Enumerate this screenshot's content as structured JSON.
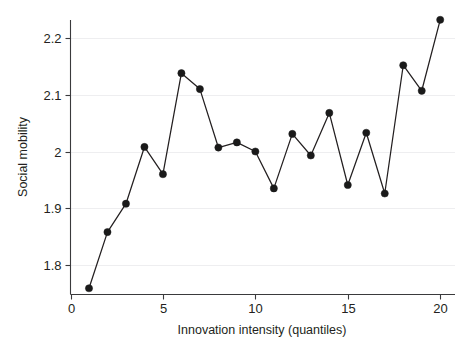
{
  "chart_data": {
    "type": "line",
    "title": "",
    "subtitle": "",
    "xlabel": "Innovation intensity (quantiles)",
    "ylabel": "Social mobility",
    "xlim": [
      0,
      20.8
    ],
    "ylim": [
      1.748,
      2.243
    ],
    "xticks": [
      0,
      5,
      10,
      15,
      20
    ],
    "xticklabels": [
      "0",
      "5",
      "10",
      "15",
      "20"
    ],
    "yticks": [
      1.8,
      1.9,
      2.0,
      2.1,
      2.2
    ],
    "yticklabels": [
      "1.8",
      "1.9",
      "2",
      "2.1",
      "2.2"
    ],
    "grid": "horizontal",
    "legend": "none",
    "marker": "filled-circle",
    "line_color": "#231f20",
    "marker_color": "#1a1a1a",
    "grid_color": "#eeeef0",
    "x": [
      1,
      2,
      3,
      4,
      5,
      6,
      7,
      8,
      9,
      10,
      11,
      12,
      13,
      14,
      15,
      16,
      17,
      18,
      19,
      20
    ],
    "values": [
      1.759,
      1.858,
      1.908,
      2.008,
      1.96,
      2.138,
      2.11,
      2.007,
      2.016,
      2.0,
      1.935,
      2.031,
      1.993,
      2.068,
      1.941,
      2.033,
      1.926,
      2.152,
      2.107,
      2.232
    ],
    "series": [
      {
        "name": "Social mobility by innovation intensity quantile",
        "values": [
          1.759,
          1.858,
          1.908,
          2.008,
          1.96,
          2.138,
          2.11,
          2.007,
          2.016,
          2.0,
          1.935,
          2.031,
          1.993,
          2.068,
          1.941,
          2.033,
          1.926,
          2.152,
          2.107,
          2.232
        ]
      }
    ],
    "annotations": []
  }
}
